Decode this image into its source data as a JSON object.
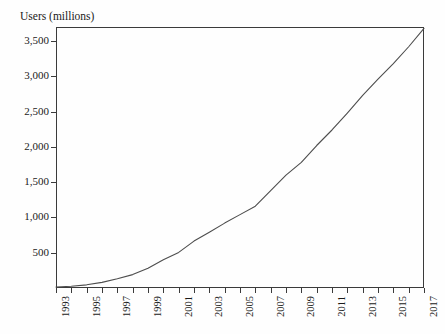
{
  "chart_data": {
    "type": "line",
    "title": "Users (millions)",
    "xlabel": "",
    "ylabel": "Users (millions)",
    "ylim": [
      0,
      3700
    ],
    "xlim": [
      1993,
      2017
    ],
    "grid": false,
    "legend": "none",
    "y_ticks": [
      500,
      1000,
      1500,
      2000,
      2500,
      3000,
      3500
    ],
    "y_tick_labels": [
      "500",
      "1,000",
      "1,500",
      "2,000",
      "2,500",
      "3,000",
      "3,500"
    ],
    "x_ticks": [
      1993,
      1994,
      1995,
      1996,
      1997,
      1998,
      1999,
      2000,
      2001,
      2002,
      2003,
      2004,
      2005,
      2006,
      2007,
      2008,
      2009,
      2010,
      2011,
      2012,
      2013,
      2014,
      2015,
      2016,
      2017
    ],
    "x_tick_labels": [
      "1993",
      "",
      "1995",
      "",
      "1997",
      "",
      "1999",
      "",
      "2001",
      "",
      "2003",
      "",
      "2005",
      "",
      "2007",
      "",
      "2009",
      "",
      "2011",
      "",
      "2013",
      "",
      "2015",
      "",
      "2017"
    ],
    "x": [
      1993,
      1994,
      1995,
      1996,
      1997,
      1998,
      1999,
      2000,
      2001,
      2002,
      2003,
      2004,
      2005,
      2006,
      2007,
      2008,
      2009,
      2010,
      2011,
      2012,
      2013,
      2014,
      2015,
      2016,
      2017
    ],
    "values": [
      14,
      25,
      45,
      80,
      130,
      190,
      280,
      400,
      505,
      665,
      790,
      920,
      1040,
      1160,
      1380,
      1600,
      1780,
      2020,
      2240,
      2480,
      2730,
      2960,
      3180,
      3420,
      3680
    ],
    "series": [
      {
        "name": "Users (millions)",
        "color": "#4d4d4d",
        "values": [
          14,
          25,
          45,
          80,
          130,
          190,
          280,
          400,
          505,
          665,
          790,
          920,
          1040,
          1160,
          1380,
          1600,
          1780,
          2020,
          2240,
          2480,
          2730,
          2960,
          3180,
          3420,
          3680
        ]
      }
    ]
  },
  "colors": {
    "line": "#4d4d4d",
    "axis": "#3b3b3b",
    "text": "#1a1a1a",
    "background": "#fefefe"
  }
}
